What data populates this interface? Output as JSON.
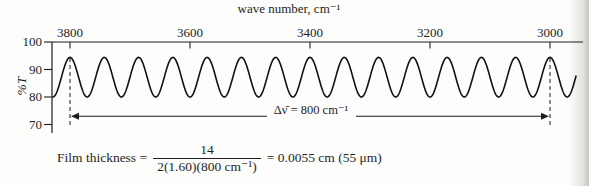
{
  "chart_data": {
    "type": "line",
    "title": "wave number, cm⁻¹",
    "xlabel": "wave number, cm⁻¹",
    "ylabel": "%T",
    "x_ticks": [
      3800,
      3600,
      3400,
      3200,
      3000
    ],
    "y_ticks": [
      100,
      90,
      80,
      70
    ],
    "xlim": [
      3830,
      2955
    ],
    "ylim": [
      66,
      100
    ],
    "x_axis_reversed": true,
    "grid": false,
    "series": [
      {
        "name": "interference fringes",
        "shape": "sinusoid",
        "percent_T_max": 94.4,
        "percent_T_min": 80,
        "first_peak_wavenumber": 3800,
        "last_peak_wavenumber": 3000,
        "num_fringes": 14,
        "fringe_spacing_wavenumber": 57.1
      }
    ],
    "annotations": [
      {
        "type": "dashed-vline",
        "x": 3800
      },
      {
        "type": "dashed-vline",
        "x": 3000
      },
      {
        "type": "double-arrow",
        "x_from": 3800,
        "x_to": 3000,
        "at_percent_T": 73,
        "label": "Δν̄ = 800 cm⁻¹"
      }
    ]
  },
  "formula": {
    "prefix": "Film thickness =",
    "numerator": "14",
    "denominator": "2(1.60)(800 cm⁻¹)",
    "result": "= 0.0055 cm (55 μm)"
  }
}
